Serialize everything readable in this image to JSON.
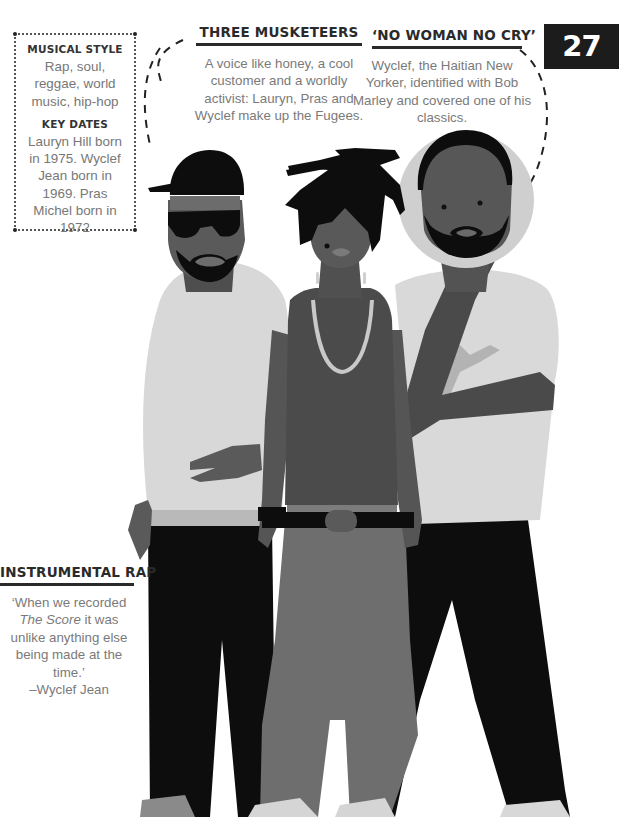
{
  "page": {
    "number": "27"
  },
  "facts": {
    "musical_style": {
      "heading": "MUSICAL STYLE",
      "text": "Rap, soul, reggae, world music, hip-hop"
    },
    "key_dates": {
      "heading": "KEY DATES",
      "text": "Lauryn Hill born in 1975. Wyclef Jean born in 1969. Pras Michel born in 1972"
    }
  },
  "sections": {
    "three_musketeers": {
      "heading": "THREE MUSKETEERS",
      "text": "A voice like honey, a cool customer and a worldly activist: Lauryn, Pras and Wyclef make up the Fugees."
    },
    "no_woman_no_cry": {
      "heading": "‘NO WOMAN NO CRY’",
      "text": "Wyclef, the Haitian New Yorker, identified with Bob Marley and covered one of his classics."
    },
    "instrumental_rap": {
      "heading": "INSTRUMENTAL RAP",
      "quote_part1": "‘When we recorded ",
      "quote_italic": "The Score",
      "quote_part2": " it was unlike anything else being made at the time.’",
      "attribution": "–Wyclef Jean"
    }
  },
  "illustration": {
    "figures": [
      "Pras Michel",
      "Lauryn Hill",
      "Wyclef Jean"
    ],
    "colors": {
      "black": "#0d0d0d",
      "skin": "#5a5a5a",
      "skin_dark": "#4a4a4a",
      "shirt_light": "#d6d6d6",
      "top_dark": "#4b4b4b",
      "pants_mid": "#6e6e6e",
      "accent_light": "#bdbdbd",
      "text_heading": "#2a2a2a",
      "text_body": "#7a7a7a"
    }
  }
}
